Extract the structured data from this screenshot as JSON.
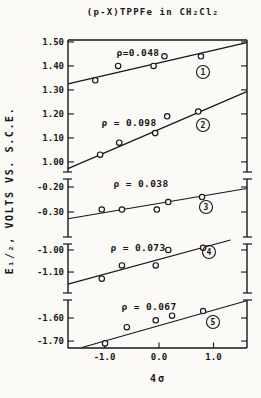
{
  "chart_data": {
    "type": "scatter",
    "title": "(p-X)TPPFe in CH₂Cl₂",
    "xlabel": "4σ",
    "ylabel": "E₁/₂, VOLTS VS. S.C.E.",
    "grid": false,
    "xlim": [
      -1.67,
      1.61
    ],
    "x_ticks": [
      {
        "value": -1.0,
        "label": "-1.0"
      },
      {
        "value": 0.0,
        "label": "0.0"
      },
      {
        "value": 1.0,
        "label": "1.0"
      }
    ],
    "axis_segments": [
      {
        "ylim": [
          0.958,
          1.508
        ],
        "ticks": [
          {
            "value": 1.5,
            "label": "1.50"
          },
          {
            "value": 1.4,
            "label": "1.40"
          },
          {
            "value": 1.3,
            "label": "1.30"
          },
          {
            "value": 1.2,
            "label": "1.20"
          },
          {
            "value": 1.1,
            "label": "1.10"
          },
          {
            "value": 1.0,
            "label": "1.00"
          }
        ]
      },
      {
        "ylim": [
          -0.4,
          -0.168
        ],
        "ticks": [
          {
            "value": -0.2,
            "label": "-0.20"
          },
          {
            "value": -0.3,
            "label": "-0.30"
          }
        ]
      },
      {
        "ylim": [
          -1.195,
          -0.973
        ],
        "ticks": [
          {
            "value": -1.0,
            "label": "-1.00"
          },
          {
            "value": -1.1,
            "label": "-1.10"
          }
        ]
      },
      {
        "ylim": [
          -1.73,
          -1.522
        ],
        "ticks": [
          {
            "value": -1.6,
            "label": "-1.60"
          },
          {
            "value": -1.7,
            "label": "-1.70"
          }
        ]
      }
    ],
    "series": [
      {
        "number": "1",
        "segment": 0,
        "rho": 0.048,
        "rho_label": "ρ=0.048",
        "line": [
          [
            -1.67,
            1.325
          ],
          [
            1.61,
            1.497
          ]
        ],
        "points": [
          [
            -1.17,
            1.34
          ],
          [
            -0.75,
            1.4
          ],
          [
            -0.1,
            1.4
          ],
          [
            0.1,
            1.44
          ],
          [
            0.77,
            1.44
          ]
        ]
      },
      {
        "number": "2",
        "segment": 0,
        "rho": 0.098,
        "rho_label": "ρ = 0.098",
        "line": [
          [
            -1.67,
            0.972
          ],
          [
            1.61,
            1.293
          ]
        ],
        "points": [
          [
            -1.08,
            1.03
          ],
          [
            -0.73,
            1.08
          ],
          [
            -0.07,
            1.12
          ],
          [
            0.15,
            1.19
          ],
          [
            0.72,
            1.21
          ]
        ]
      },
      {
        "number": "3",
        "segment": 1,
        "rho": 0.038,
        "rho_label": "ρ = 0.038",
        "line": [
          [
            -1.67,
            -0.327
          ],
          [
            1.61,
            -0.206
          ]
        ],
        "points": [
          [
            -1.05,
            -0.29
          ],
          [
            -0.68,
            -0.29
          ],
          [
            -0.04,
            -0.29
          ],
          [
            0.17,
            -0.26
          ],
          [
            0.79,
            -0.24
          ]
        ]
      },
      {
        "number": "4",
        "segment": 2,
        "rho": 0.073,
        "rho_label": "ρ = 0.073",
        "line": [
          [
            -1.67,
            -1.155
          ],
          [
            1.61,
            -0.935
          ]
        ],
        "points": [
          [
            -1.05,
            -1.13
          ],
          [
            -0.68,
            -1.07
          ],
          [
            -0.06,
            -1.07
          ],
          [
            0.17,
            -1.0
          ],
          [
            0.81,
            -0.99
          ]
        ]
      },
      {
        "number": "5",
        "segment": 3,
        "rho": 0.067,
        "rho_label": "ρ = 0.067",
        "line": [
          [
            -1.67,
            -1.745
          ],
          [
            1.61,
            -1.525
          ]
        ],
        "points": [
          [
            -0.99,
            -1.71
          ],
          [
            -0.59,
            -1.64
          ],
          [
            -0.06,
            -1.61
          ],
          [
            0.24,
            -1.59
          ],
          [
            0.81,
            -1.57
          ]
        ]
      }
    ],
    "colors": {
      "ink": "#161616",
      "paper": "#fbfaf6"
    }
  }
}
